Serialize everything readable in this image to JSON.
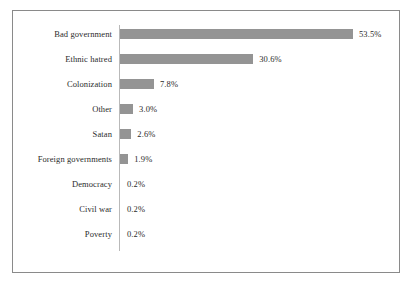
{
  "chart_data": {
    "type": "bar",
    "orientation": "horizontal",
    "title": "",
    "subtitle": "",
    "xlabel": "",
    "ylabel": "",
    "grid": false,
    "legend": false,
    "axis_line": true,
    "xlim": [
      0,
      53.5
    ],
    "categories": [
      "Bad government",
      "Ethnic hatred",
      "Colonization",
      "Other",
      "Satan",
      "Foreign governments",
      "Democracy",
      "Civil war",
      "Poverty"
    ],
    "values": [
      53.5,
      30.6,
      7.8,
      3.0,
      2.6,
      1.9,
      0.2,
      0.2,
      0.2
    ],
    "value_labels": [
      "53.5%",
      "30.6%",
      "7.8%",
      "3.0%",
      "2.6%",
      "1.9%",
      "0.2%",
      "0.2%",
      "0.2%"
    ]
  },
  "style": {
    "bar_color": "#949494",
    "axis_color": "#b9b9b9",
    "border_color": "#8a8a8a",
    "text_color": "#2b2b2b",
    "background": "#ffffff"
  }
}
